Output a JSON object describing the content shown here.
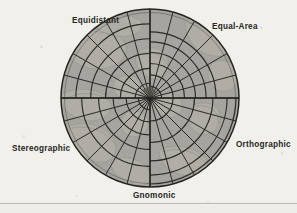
{
  "figure": {
    "kind": "polar-azimuthal-projection-comparison",
    "labels": {
      "equidistant": "Equidistant",
      "equal_area": "Equal-Area",
      "orthographic": "Orthographic",
      "stereographic": "Stereographic",
      "gnomonic": "Gnomonic"
    },
    "disc": {
      "center_x": 150,
      "center_y": 98,
      "radius": 89,
      "fill_color": "#a9a8a3",
      "land_color": "#b7b5ad",
      "graticule_color": "#2b2a26",
      "background_color": "#f2f0eb"
    },
    "graticule": {
      "meridian_count": 24,
      "meridian_spacing_degrees": 15,
      "parallel_count": 6,
      "sector_divider_angles_deg": [
        0,
        90,
        180,
        270
      ]
    },
    "sectors": [
      {
        "name": "Equidistant",
        "start_deg": 180,
        "end_deg": 270,
        "parallel_radii_frac": [
          0.167,
          0.333,
          0.5,
          0.667,
          0.833,
          1.0
        ]
      },
      {
        "name": "Equal-Area",
        "start_deg": 270,
        "end_deg": 360,
        "parallel_radii_frac": [
          0.131,
          0.261,
          0.388,
          0.511,
          0.63,
          0.743
        ]
      },
      {
        "name": "Orthographic",
        "start_deg": 0,
        "end_deg": 90,
        "parallel_radii_frac": [
          0.259,
          0.5,
          0.707,
          0.866,
          0.966,
          1.0
        ]
      },
      {
        "name": "Gnomonic",
        "start_deg": 90,
        "end_deg": 180,
        "parallel_radii_frac": [
          0.088,
          0.184,
          0.3,
          0.445,
          0.643,
          1.0
        ]
      },
      {
        "name": "Stereographic",
        "start_deg": 180,
        "end_deg": 190,
        "parallel_radii_frac": [
          0.131,
          0.268,
          0.414,
          0.577,
          0.767,
          1.0
        ]
      }
    ],
    "page_rule_color": "#b9b7b1"
  }
}
